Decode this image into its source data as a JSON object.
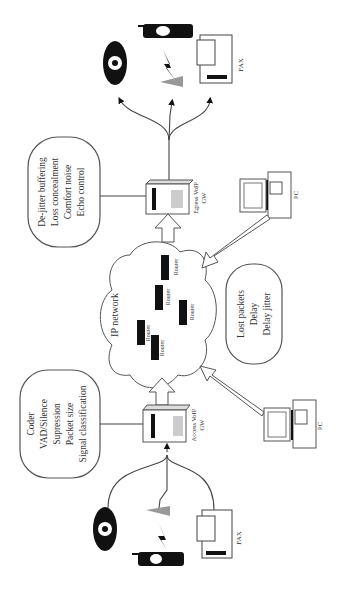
{
  "diagram": {
    "orientation": "rotated-90-ccw",
    "colors": {
      "ink": "#222222",
      "background": "#ffffff",
      "line": "#444444"
    },
    "access_features": [
      "Coder",
      "VAD/Silence",
      "Supression",
      "Packet size",
      "Signal classification"
    ],
    "egress_features": [
      "De-jitter buffering",
      "Loss concealment",
      "Comfort noise",
      "Echo control"
    ],
    "network_impairments": [
      "Lost packets",
      "Delay",
      "Delay jitter"
    ],
    "network_label": "IP network",
    "router_label": "Router",
    "access_gw_label": [
      "Access VoIP",
      "GW"
    ],
    "egress_gw_label": [
      "Egress VoIP",
      "GW"
    ],
    "fax_label": "FAX",
    "pc_label": "PC",
    "devices": [
      "telephone",
      "mobile-phone",
      "fax"
    ]
  }
}
